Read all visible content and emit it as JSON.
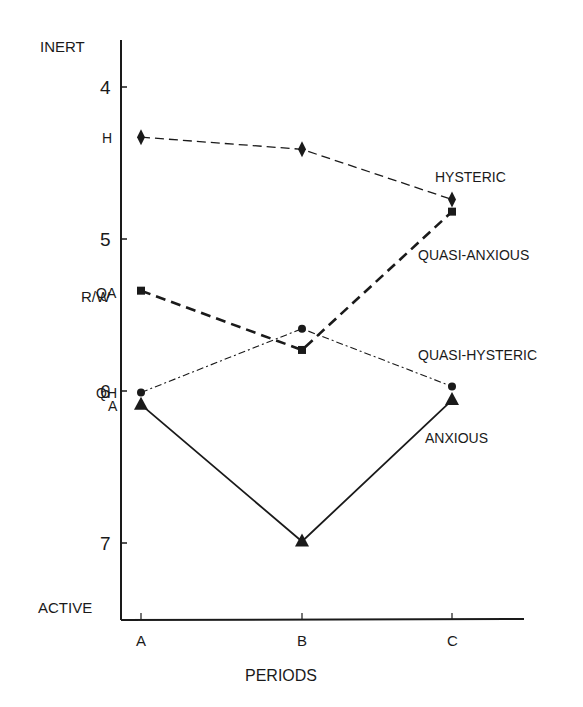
{
  "chart_data": {
    "type": "line",
    "title": "",
    "xlabel": "PERIODS",
    "ylabel": "",
    "y_top_label": "INERT",
    "y_bottom_label": "ACTIVE",
    "y_marker_label": "R/W",
    "y_marker_value": 5.35,
    "y_inverted": true,
    "ylim": [
      3.5,
      7.5
    ],
    "y_ticks": [
      4,
      5,
      6,
      7
    ],
    "categories": [
      "A",
      "B",
      "C"
    ],
    "grid": false,
    "legend_position": "inline-right",
    "series": [
      {
        "name": "HYSTERIC",
        "short": "H",
        "marker": "diamond",
        "line": "dashed-long",
        "values": [
          4.33,
          4.41,
          4.74
        ]
      },
      {
        "name": "QUASI-ANXIOUS",
        "short": "QA",
        "marker": "square",
        "line": "dashed-bold",
        "values": [
          5.34,
          5.73,
          4.82
        ]
      },
      {
        "name": "QUASI-HYSTERIC",
        "short": "QH",
        "marker": "circle",
        "line": "dash-dot",
        "values": [
          6.01,
          5.59,
          5.97
        ]
      },
      {
        "name": "ANXIOUS",
        "short": "A",
        "marker": "triangle",
        "line": "solid",
        "values": [
          6.09,
          6.99,
          6.06
        ]
      }
    ]
  }
}
